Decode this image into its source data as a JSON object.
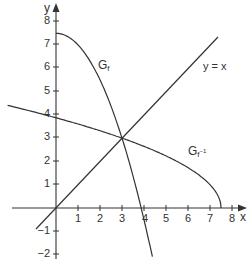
{
  "chart_data": {
    "type": "line",
    "title": "",
    "xlabel": "x",
    "ylabel": "y",
    "xlim": [
      -2.5,
      8.5
    ],
    "ylim": [
      -2.3,
      8.5
    ],
    "grid": false,
    "legend": "none (inline labels)",
    "x_ticks": [
      1,
      2,
      3,
      4,
      5,
      6,
      7,
      8
    ],
    "y_ticks": [
      -2,
      -1,
      1,
      2,
      3,
      4,
      5,
      6,
      7,
      8
    ],
    "series": [
      {
        "name": "G_f",
        "label": "Gf",
        "formula_estimate": "f(x) = 7.5 - 0.5x^2, x >= 0",
        "x": [
          0,
          0.5,
          1,
          1.5,
          2,
          2.5,
          3,
          3.5,
          3.87,
          4.38
        ],
        "y": [
          7.5,
          7.375,
          7.0,
          6.375,
          5.5,
          4.375,
          3.0,
          1.375,
          0.0,
          -2.1
        ]
      },
      {
        "name": "G_{f^-1}",
        "label": "Gf⁻¹",
        "formula_estimate": "f^-1(x) = sqrt(15 - 2x), x <= 7.5",
        "x": [
          -2.2,
          -1,
          0,
          1,
          2,
          3,
          4,
          5,
          6,
          7,
          7.5
        ],
        "y": [
          4.4,
          4.12,
          3.87,
          3.61,
          3.32,
          3.0,
          2.65,
          2.24,
          1.73,
          1.0,
          0.0
        ]
      },
      {
        "name": "y = x",
        "label": "y = x",
        "x": [
          -0.9,
          7.35
        ],
        "y": [
          -0.9,
          7.35
        ]
      }
    ],
    "annotations": [
      {
        "text": "Gf",
        "x": 2.0,
        "y": 6.2
      },
      {
        "text": "y = x",
        "x": 6.6,
        "y": 6.0
      },
      {
        "text": "Gf⁻¹",
        "x": 5.9,
        "y": 2.5
      }
    ],
    "intersection": {
      "x": 3,
      "y": 3
    }
  },
  "axes": {
    "x_label": "x",
    "y_label": "y",
    "x_ticks": [
      "1",
      "2",
      "3",
      "4",
      "5",
      "6",
      "7",
      "8"
    ],
    "y_ticks_pos": [
      "1",
      "2",
      "3",
      "4",
      "5",
      "6",
      "7",
      "8"
    ],
    "y_ticks_neg": [
      "−1",
      "−2"
    ]
  },
  "labels": {
    "gf_main": "G",
    "gf_sub": "f",
    "line": "y = x",
    "ginv_main": "G",
    "ginv_sub": "f",
    "ginv_sup": "−1"
  },
  "colors": {
    "axis": "#333333",
    "curve": "#333333",
    "background": "#ffffff"
  }
}
